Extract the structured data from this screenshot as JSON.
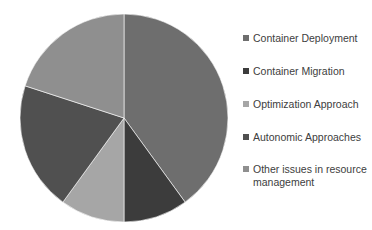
{
  "chart_data": {
    "type": "pie",
    "title": "",
    "categories": [
      "Container Deployment",
      "Container Migration",
      "Optimization Approach",
      "Autonomic Approaches",
      "Other issues in resource management"
    ],
    "values": [
      40,
      10,
      10,
      20,
      20
    ],
    "colors": [
      "#6e6e6e",
      "#3c3c3c",
      "#a6a6a6",
      "#505050",
      "#8f8f8f"
    ],
    "start_angle": "12 o'clock, clockwise",
    "legend_position": "right",
    "data_labels": false
  },
  "legend": {
    "items": [
      {
        "label": "Container Deployment",
        "color": "#6e6e6e"
      },
      {
        "label": "Container Migration",
        "color": "#3c3c3c"
      },
      {
        "label": "Optimization Approach",
        "color": "#a6a6a6"
      },
      {
        "label": "Autonomic Approaches",
        "color": "#505050"
      },
      {
        "label": "Other issues in resource management",
        "color": "#8f8f8f"
      }
    ]
  }
}
